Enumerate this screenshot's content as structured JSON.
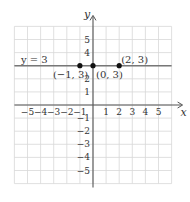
{
  "chart_data": {
    "type": "line",
    "title": "",
    "xlabel": "x",
    "ylabel": "y",
    "xlim": [
      -6,
      6
    ],
    "ylim": [
      -6,
      6
    ],
    "grid": true,
    "x_ticks": [
      "-5",
      "-4",
      "-3",
      "-2",
      "-1",
      "1",
      "2",
      "3",
      "4",
      "5"
    ],
    "y_ticks": [
      "5",
      "4",
      "2",
      "1",
      "-1",
      "-2",
      "-3",
      "-4",
      "-5"
    ],
    "series": [
      {
        "name": "y = 3",
        "equation": "y = 3",
        "type": "horizontal-line",
        "y": 3
      }
    ],
    "points": [
      {
        "label": "(−1, 3)",
        "x": -1,
        "y": 3
      },
      {
        "label": "(0, 3)",
        "x": 0,
        "y": 3
      },
      {
        "label": "(2, 3)",
        "x": 2,
        "y": 3
      }
    ],
    "line_label": "y = 3",
    "colors": {
      "grid": "#d8d8d8",
      "axis": "#555555",
      "line": "#777777",
      "point": "#111111"
    }
  }
}
